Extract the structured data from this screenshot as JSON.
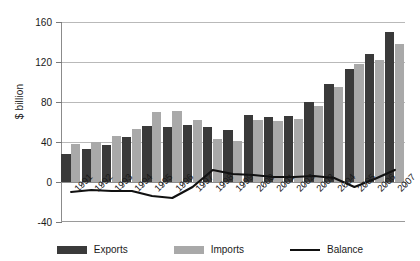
{
  "chart_data": {
    "type": "bar",
    "title": "",
    "subtitle": "",
    "xlabel": "",
    "ylabel": "$ billion",
    "ylim": [
      -40,
      160
    ],
    "ytick_values": [
      -40,
      0,
      40,
      80,
      120,
      160
    ],
    "ytick_labels": [
      "-40",
      "0",
      "40",
      "80",
      "120",
      "160"
    ],
    "grid": true,
    "legend_position": "bottom",
    "categories": [
      "1991",
      "1992",
      "1993",
      "1994",
      "1995",
      "1996",
      "1997",
      "1998",
      "1999",
      "2000",
      "2001",
      "2002",
      "2003",
      "2004",
      "2005",
      "2006",
      "2007"
    ],
    "series": [
      {
        "name": "Exports",
        "chart_type": "bar",
        "color": "#3a3a3a",
        "values": [
          28,
          33,
          37,
          45,
          56,
          55,
          57,
          55,
          52,
          67,
          65,
          66,
          80,
          98,
          113,
          128,
          150
        ]
      },
      {
        "name": "Imports",
        "chart_type": "bar",
        "color": "#a9a9a9",
        "values": [
          38,
          40,
          46,
          53,
          70,
          71,
          62,
          43,
          41,
          62,
          61,
          63,
          76,
          95,
          118,
          122,
          138
        ]
      },
      {
        "name": "Balance",
        "chart_type": "line",
        "color": "#111111",
        "values": [
          -10,
          -8,
          -9,
          -9,
          -14,
          -16,
          -5,
          12,
          8,
          7,
          5,
          5,
          6,
          4,
          -5,
          3,
          12
        ]
      }
    ]
  },
  "legend": {
    "items": [
      {
        "label": "Exports",
        "swatch": "exports"
      },
      {
        "label": "Imports",
        "swatch": "imports"
      },
      {
        "label": "Balance",
        "swatch": "balance"
      }
    ]
  }
}
